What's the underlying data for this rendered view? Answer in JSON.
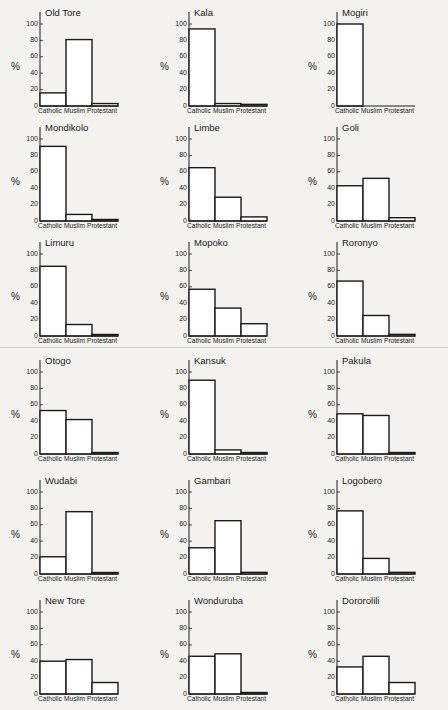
{
  "chart_data": [
    {
      "type": "bar",
      "title": "Old Tore",
      "categories": [
        "Catholic",
        "Muslim",
        "Protestant"
      ],
      "values": [
        16,
        81,
        3
      ],
      "ylabel": "%",
      "yticks": [
        0,
        20,
        40,
        60,
        80,
        100
      ],
      "ylim": [
        0,
        100
      ]
    },
    {
      "type": "bar",
      "title": "Kala",
      "categories": [
        "Catholic",
        "Muslim",
        "Protestant"
      ],
      "values": [
        94,
        3,
        2
      ],
      "ylabel": "%",
      "yticks": [
        0,
        20,
        40,
        60,
        80,
        100
      ],
      "ylim": [
        0,
        100
      ]
    },
    {
      "type": "bar",
      "title": "Mogiri",
      "categories": [
        "Catholic",
        "Muslim",
        "Protestant"
      ],
      "values": [
        100,
        0,
        0
      ],
      "ylabel": "%",
      "yticks": [
        0,
        20,
        40,
        60,
        80,
        100
      ],
      "ylim": [
        0,
        100
      ]
    },
    {
      "type": "bar",
      "title": "Mondikolo",
      "categories": [
        "Catholic",
        "Muslim",
        "Protestant"
      ],
      "values": [
        91,
        8,
        1
      ],
      "ylabel": "%",
      "yticks": [
        0,
        20,
        40,
        60,
        80,
        100
      ],
      "ylim": [
        0,
        100
      ]
    },
    {
      "type": "bar",
      "title": "Limbe",
      "categories": [
        "Catholic",
        "Muslim",
        "Protestant"
      ],
      "values": [
        65,
        29,
        5
      ],
      "ylabel": "%",
      "yticks": [
        0,
        20,
        40,
        60,
        80,
        100
      ],
      "ylim": [
        0,
        100
      ]
    },
    {
      "type": "bar",
      "title": "Goli",
      "categories": [
        "Catholic",
        "Muslim",
        "Protestant"
      ],
      "values": [
        43,
        52,
        4
      ],
      "ylabel": "%",
      "yticks": [
        0,
        20,
        40,
        60,
        80,
        100
      ],
      "ylim": [
        0,
        100
      ]
    },
    {
      "type": "bar",
      "title": "Limuru",
      "categories": [
        "Catholic",
        "Muslim",
        "Protestant"
      ],
      "values": [
        85,
        14,
        1
      ],
      "ylabel": "%",
      "yticks": [
        0,
        20,
        40,
        60,
        80,
        100
      ],
      "ylim": [
        0,
        100
      ]
    },
    {
      "type": "bar",
      "title": "Mopoko",
      "categories": [
        "Catholic",
        "Muslim",
        "Protestant"
      ],
      "values": [
        57,
        34,
        15
      ],
      "ylabel": "%",
      "yticks": [
        0,
        20,
        40,
        60,
        80,
        100
      ],
      "ylim": [
        0,
        100
      ]
    },
    {
      "type": "bar",
      "title": "Roronyo",
      "categories": [
        "Catholic",
        "Muslim",
        "Protestant"
      ],
      "values": [
        67,
        25,
        2
      ],
      "ylabel": "%",
      "yticks": [
        0,
        20,
        40,
        60,
        80,
        100
      ],
      "ylim": [
        0,
        100
      ]
    },
    {
      "type": "bar",
      "title": "Otogo",
      "categories": [
        "Catholic",
        "Muslim",
        "Protestant"
      ],
      "values": [
        53,
        42,
        1
      ],
      "ylabel": "%",
      "yticks": [
        0,
        20,
        40,
        60,
        80,
        100
      ],
      "ylim": [
        0,
        100
      ]
    },
    {
      "type": "bar",
      "title": "Kansuk",
      "categories": [
        "Catholic",
        "Muslim",
        "Protestant"
      ],
      "values": [
        90,
        5,
        1
      ],
      "ylabel": "%",
      "yticks": [
        0,
        20,
        40,
        60,
        80,
        100
      ],
      "ylim": [
        0,
        100
      ]
    },
    {
      "type": "bar",
      "title": "Pakula",
      "categories": [
        "Catholic",
        "Muslim",
        "Protestant"
      ],
      "values": [
        49,
        47,
        1
      ],
      "ylabel": "%",
      "yticks": [
        0,
        20,
        40,
        60,
        80,
        100
      ],
      "ylim": [
        0,
        100
      ]
    },
    {
      "type": "bar",
      "title": "Wudabi",
      "categories": [
        "Catholic",
        "Muslim",
        "Protestant"
      ],
      "values": [
        21,
        76,
        1
      ],
      "ylabel": "%",
      "yticks": [
        0,
        20,
        40,
        60,
        80,
        100
      ],
      "ylim": [
        0,
        100
      ]
    },
    {
      "type": "bar",
      "title": "Gambari",
      "categories": [
        "Catholic",
        "Muslim",
        "Protestant"
      ],
      "values": [
        32,
        65,
        2
      ],
      "ylabel": "%",
      "yticks": [
        0,
        20,
        40,
        60,
        80,
        100
      ],
      "ylim": [
        0,
        100
      ]
    },
    {
      "type": "bar",
      "title": "Logobero",
      "categories": [
        "Catholic",
        "Muslim",
        "Protestant"
      ],
      "values": [
        77,
        19,
        2
      ],
      "ylabel": "%",
      "yticks": [
        0,
        20,
        40,
        60,
        80,
        100
      ],
      "ylim": [
        0,
        100
      ]
    },
    {
      "type": "bar",
      "title": "New Tore",
      "categories": [
        "Catholic",
        "Muslim",
        "Protestant"
      ],
      "values": [
        40,
        42,
        14
      ],
      "ylabel": "%",
      "yticks": [
        0,
        20,
        40,
        60,
        80,
        100
      ],
      "ylim": [
        0,
        100
      ]
    },
    {
      "type": "bar",
      "title": "Wonduruba",
      "categories": [
        "Catholic",
        "Muslim",
        "Protestant"
      ],
      "values": [
        46,
        49,
        1
      ],
      "ylabel": "%",
      "yticks": [
        0,
        20,
        40,
        60,
        80,
        100
      ],
      "ylim": [
        0,
        100
      ]
    },
    {
      "type": "bar",
      "title": "Dororolili",
      "categories": [
        "Catholic",
        "Muslim",
        "Protestant"
      ],
      "values": [
        33,
        46,
        14
      ],
      "ylabel": "%",
      "yticks": [
        0,
        20,
        40,
        60,
        80,
        100
      ],
      "ylim": [
        0,
        100
      ]
    }
  ],
  "layout": {
    "columns": 3,
    "rows": 6,
    "background": "#f3f2ef",
    "bar_stroke": "#1a1a1a",
    "bar_fill": "#ffffff"
  }
}
